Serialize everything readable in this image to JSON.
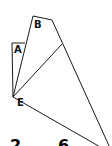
{
  "diagram": {
    "type": "geometric-figure",
    "stroke_color": "#1a1a1a",
    "background": "#ffffff",
    "labels": {
      "A": "A",
      "B": "B",
      "E": "E"
    },
    "vertices": {
      "E": [
        13,
        97
      ],
      "A_top_left": [
        12,
        43
      ],
      "A_top_right": [
        25,
        43
      ],
      "B_top_left": [
        33,
        16
      ],
      "B_top_right": [
        52,
        20
      ],
      "inner_end": [
        62,
        44
      ],
      "bottom_right": [
        108,
        146
      ],
      "bottom_mid": [
        100,
        146
      ]
    },
    "bottom_text_cut": "2 6"
  }
}
